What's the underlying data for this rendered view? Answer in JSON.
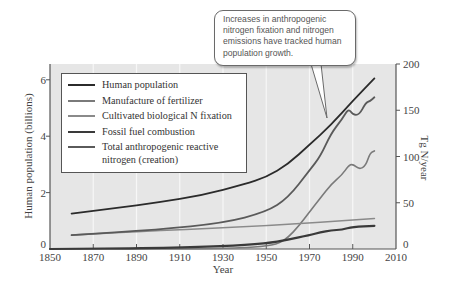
{
  "chart_data": {
    "type": "line",
    "title": "",
    "xlabel": "Year",
    "ylabel_left": "Human population (billions)",
    "ylabel_right": "Tg N/year",
    "xlim": [
      1850,
      2010
    ],
    "ylim_left": [
      0,
      6.56
    ],
    "ylim_right": [
      0,
      200
    ],
    "x_ticks": [
      1850,
      1870,
      1890,
      1910,
      1930,
      1950,
      1970,
      1990,
      2010
    ],
    "y_ticks_left": [
      0,
      2,
      4,
      6
    ],
    "y_ticks_right": [
      0,
      50,
      100,
      150,
      200
    ],
    "grid": "vertical",
    "legend_position": "upper left",
    "series": [
      {
        "name": "Human population",
        "axis": "left",
        "color": "#2b2b2b",
        "x": [
          1860,
          1880,
          1900,
          1920,
          1940,
          1950,
          1960,
          1970,
          1980,
          1990,
          2000
        ],
        "values": [
          1.25,
          1.45,
          1.65,
          1.9,
          2.3,
          2.55,
          3.0,
          3.7,
          4.4,
          5.25,
          6.05
        ]
      },
      {
        "name": "Manufacture of fertilizer",
        "axis": "right",
        "color": "#7a7a7a",
        "x": [
          1850,
          1900,
          1930,
          1945,
          1955,
          1960,
          1965,
          1970,
          1975,
          1980,
          1985,
          1988,
          1990,
          1993,
          1996,
          1998,
          2000
        ],
        "values": [
          0,
          0,
          0.5,
          2,
          5,
          12,
          25,
          40,
          55,
          70,
          80,
          90,
          92,
          86,
          90,
          104,
          106
        ]
      },
      {
        "name": "Cultivated biological N fixation",
        "axis": "right",
        "color": "#8a8a8a",
        "x": [
          1860,
          1900,
          1950,
          2000
        ],
        "values": [
          15,
          20,
          25,
          33
        ]
      },
      {
        "name": "Fossil fuel combustion",
        "axis": "right",
        "color": "#3a3a3a",
        "x": [
          1850,
          1900,
          1930,
          1950,
          1960,
          1970,
          1975,
          1980,
          1985,
          1990,
          2000
        ],
        "values": [
          0,
          1,
          3,
          6,
          10,
          15,
          18,
          20,
          21,
          24,
          25
        ]
      },
      {
        "name": "Total anthropogenic reactive nitrogen (creation)",
        "axis": "right",
        "color": "#5a5a5a",
        "x": [
          1860,
          1900,
          1930,
          1950,
          1960,
          1970,
          1975,
          1980,
          1985,
          1988,
          1990,
          1993,
          1996,
          1998,
          2000
        ],
        "values": [
          15,
          21,
          28,
          40,
          55,
          85,
          100,
          125,
          140,
          152,
          145,
          145,
          158,
          160,
          164
        ]
      }
    ],
    "annotations": [
      "Increases in anthropogenic nitrogen fixation and nitrogen emissions have tracked human population growth."
    ]
  },
  "callout": {
    "lines": [
      "Increases in anthropogenic",
      "nitrogen fixation and nitrogen",
      "emissions have tracked human",
      "population growth."
    ]
  },
  "legend": {
    "items": [
      {
        "label": "Human population",
        "color": "#2b2b2b"
      },
      {
        "label": "Manufacture of fertilizer",
        "color": "#7a7a7a"
      },
      {
        "label": "Cultivated biological N fixation",
        "color": "#8a8a8a"
      },
      {
        "label": "Fossil fuel combustion",
        "color": "#3a3a3a"
      },
      {
        "label": "Total anthropogenic reactive",
        "label2": "nitrogen (creation)",
        "color": "#5a5a5a"
      }
    ]
  },
  "axes": {
    "xlabel": "Year",
    "ylabel_left": "Human population (billions)",
    "ylabel_right": "Tg N/year",
    "x_ticks": [
      "1850",
      "1870",
      "1890",
      "1910",
      "1930",
      "1950",
      "1970",
      "1990",
      "2010"
    ],
    "left_ticks": [
      "0",
      "2",
      "4",
      "6"
    ],
    "right_ticks": [
      "0",
      "50",
      "100",
      "150",
      "200"
    ]
  }
}
